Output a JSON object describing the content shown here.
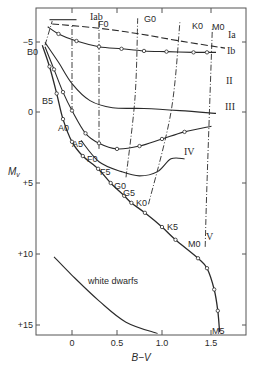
{
  "chart_data": {
    "type": "line",
    "title": "",
    "xlabel": "B−V",
    "ylabel": "Mv",
    "xlim": [
      -0.4,
      1.9
    ],
    "ylim": [
      -6.6,
      15.6
    ],
    "y_inverted": true,
    "xticks": [
      0,
      0.5,
      1.0,
      1.5
    ],
    "xtick_labels": [
      "0",
      "0.5",
      "1.0",
      "1.5"
    ],
    "yticks": [
      -5,
      0,
      5,
      10,
      15
    ],
    "ytick_labels": [
      "−5",
      "0",
      "+5",
      "+10",
      "+15"
    ],
    "grid": false,
    "series": [
      {
        "name": "Ia",
        "style": "dashed",
        "points": [
          [
            -0.22,
            -6.2
          ],
          [
            0.3,
            -5.9
          ],
          [
            0.75,
            -5.5
          ],
          [
            1.2,
            -5.0
          ],
          [
            1.7,
            -4.5
          ]
        ]
      },
      {
        "name": "Iab",
        "style": "solid",
        "points": [
          [
            -0.25,
            -6.5
          ],
          [
            0.05,
            -6.5
          ]
        ]
      },
      {
        "name": "Ib",
        "style": "solid",
        "markers": true,
        "points": [
          [
            -0.27,
            -6.0
          ],
          [
            -0.15,
            -5.5
          ],
          [
            0.05,
            -5.0
          ],
          [
            0.3,
            -4.6
          ],
          [
            0.55,
            -4.45
          ],
          [
            0.8,
            -4.3
          ],
          [
            1.05,
            -4.25
          ],
          [
            1.35,
            -4.2
          ],
          [
            1.5,
            -4.2
          ],
          [
            1.6,
            -4.2
          ]
        ]
      },
      {
        "name": "II",
        "style": "solid",
        "points": [
          [
            -0.3,
            -4.9
          ],
          [
            -0.15,
            -3.5
          ],
          [
            0.0,
            -2.0
          ],
          [
            0.2,
            -0.8
          ],
          [
            0.45,
            -0.3
          ],
          [
            0.8,
            -0.25
          ],
          [
            1.2,
            -0.1
          ],
          [
            1.6,
            0.1
          ]
        ]
      },
      {
        "name": "III",
        "style": "solid",
        "markers": true,
        "points": [
          [
            -0.3,
            -4.6
          ],
          [
            -0.2,
            -3.0
          ],
          [
            -0.1,
            -1.4
          ],
          [
            0.0,
            -0.1
          ],
          [
            0.15,
            1.5
          ],
          [
            0.3,
            2.2
          ],
          [
            0.5,
            2.6
          ],
          [
            0.75,
            2.4
          ],
          [
            1.0,
            1.9
          ],
          [
            1.25,
            1.4
          ],
          [
            1.55,
            1.0
          ]
        ]
      },
      {
        "name": "IV",
        "style": "solid",
        "points": [
          [
            0.1,
            2.0
          ],
          [
            0.3,
            3.5
          ],
          [
            0.55,
            4.2
          ],
          [
            0.75,
            4.5
          ],
          [
            0.95,
            4.2
          ],
          [
            1.1,
            3.3
          ],
          [
            1.25,
            3.3
          ]
        ]
      },
      {
        "name": "V",
        "style": "solid",
        "markers": true,
        "points": [
          [
            -0.33,
            -4.7
          ],
          [
            -0.25,
            -3.2
          ],
          [
            -0.17,
            -1.3
          ],
          [
            -0.1,
            0.5
          ],
          [
            0.0,
            2.1
          ],
          [
            0.12,
            3.1
          ],
          [
            0.29,
            4.0
          ],
          [
            0.43,
            5.0
          ],
          [
            0.58,
            5.9
          ],
          [
            0.66,
            6.4
          ],
          [
            0.81,
            7.1
          ],
          [
            1.0,
            8.1
          ],
          [
            1.15,
            9.0
          ],
          [
            1.4,
            10.3
          ],
          [
            1.5,
            11.0
          ],
          [
            1.58,
            12.5
          ],
          [
            1.62,
            14.0
          ],
          [
            1.64,
            15.5
          ]
        ]
      },
      {
        "name": "white dwarfs",
        "style": "solid",
        "points": [
          [
            -0.2,
            10.2
          ],
          [
            0.0,
            11.5
          ],
          [
            0.3,
            13.3
          ],
          [
            0.6,
            14.8
          ],
          [
            0.95,
            15.6
          ]
        ]
      }
    ],
    "spectral_isolines": [
      {
        "name": "B0",
        "points": [
          [
            -0.3,
            -4.7
          ],
          [
            -0.22,
            -6.4
          ]
        ]
      },
      {
        "name": "A0",
        "points": [
          [
            0.0,
            0.0
          ],
          [
            0.0,
            -6.2
          ]
        ]
      },
      {
        "name": "F0",
        "points": [
          [
            0.3,
            2.6
          ],
          [
            0.3,
            -6.5
          ]
        ]
      },
      {
        "name": "G0",
        "points": [
          [
            0.6,
            4.6
          ],
          [
            0.7,
            -1.0
          ],
          [
            0.73,
            -6.6
          ]
        ]
      },
      {
        "name": "K0",
        "points": [
          [
            0.85,
            6.5
          ],
          [
            1.1,
            0.0
          ],
          [
            1.2,
            -6.4
          ]
        ]
      },
      {
        "name": "M0",
        "points": [
          [
            1.48,
            9.5
          ],
          [
            1.5,
            5.0
          ],
          [
            1.56,
            -6.0
          ]
        ]
      }
    ],
    "annotations": {
      "luminosity_classes": [
        "Ia",
        "Iab",
        "Ib",
        "II",
        "III",
        "IV",
        "V"
      ],
      "spectral_types_top": [
        "F0",
        "G0",
        "K0",
        "M0"
      ],
      "main_sequence_labels": [
        "B0",
        "B5",
        "A0",
        "A5",
        "F0",
        "F5",
        "G0",
        "G5",
        "K0",
        "K5",
        "M0",
        "M5"
      ],
      "white_dwarfs_label": "white dwarfs"
    }
  },
  "labels": {
    "xaxis": "B−V",
    "yaxis_main": "M",
    "yaxis_sub": "v",
    "ia": "Ia",
    "iab": "Iab",
    "ib": "Ib",
    "ii": "II",
    "iii": "III",
    "iv": "IV",
    "v": "V",
    "top_f0": "F0",
    "top_g0": "G0",
    "top_k0": "K0",
    "top_m0": "M0",
    "ms_b0": "B0",
    "ms_b5": "B5",
    "ms_a0": "A0",
    "ms_a5": "A5",
    "ms_f0": "F0",
    "ms_f5": "F5",
    "ms_g0": "G0",
    "ms_g5": "G5",
    "ms_k0": "K0",
    "ms_k5": "K5",
    "ms_m0": "M0",
    "ms_m5": "M5",
    "white_dwarfs": "white dwarfs",
    "xt0": "0",
    "xt1": "0.5",
    "xt2": "1.0",
    "xt3": "1.5",
    "yt0": "−5",
    "yt1": "0",
    "yt2": "+5",
    "yt3": "+10",
    "yt4": "+15"
  }
}
